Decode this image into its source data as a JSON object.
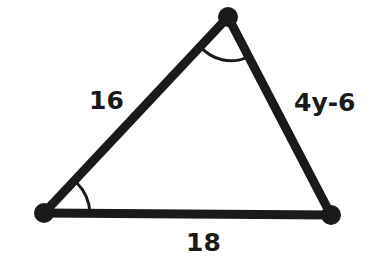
{
  "figure": {
    "type": "triangle",
    "vertices": {
      "top": {
        "x": 228,
        "y": 17
      },
      "bottom_left": {
        "x": 44,
        "y": 213
      },
      "bottom_right": {
        "x": 331,
        "y": 215
      }
    },
    "sides": {
      "left": {
        "label": "16"
      },
      "right": {
        "label": "4y-6"
      },
      "bottom": {
        "label": "18"
      }
    },
    "angle_marks": [
      {
        "vertex": "top",
        "arcs": 1
      },
      {
        "vertex": "bottom_left",
        "arcs": 1
      }
    ],
    "stroke_color": "#1a1a1a",
    "background": "#ffffff"
  }
}
